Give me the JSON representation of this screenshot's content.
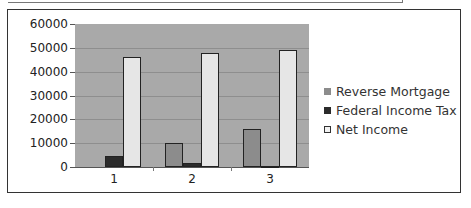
{
  "chart_data": {
    "type": "bar",
    "title": "",
    "xlabel": "",
    "ylabel": "",
    "categories": [
      "1",
      "2",
      "3"
    ],
    "ylim": [
      0,
      60000
    ],
    "yticks": [
      "0",
      "10000",
      "20000",
      "30000",
      "40000",
      "50000",
      "60000"
    ],
    "grid": true,
    "legend_position": "right",
    "series": [
      {
        "name": "Reverse Mortgage",
        "color": "#8c8c8c",
        "values": [
          0,
          10000,
          16000
        ]
      },
      {
        "name": "Federal Income Tax",
        "color": "#2b2b2b",
        "values": [
          4500,
          1700,
          500
        ]
      },
      {
        "name": "Net Income",
        "color": "#e6e6e6",
        "values": [
          46000,
          48000,
          49000
        ]
      }
    ]
  },
  "legend": {
    "items": [
      "Reverse Mortgage",
      "Federal Income Tax",
      "Net Income"
    ]
  }
}
